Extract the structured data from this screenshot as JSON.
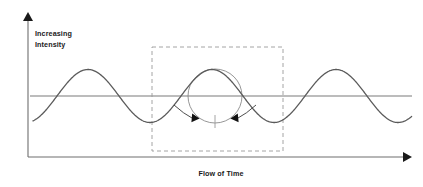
{
  "figure": {
    "background_color": "#ffffff"
  },
  "axes": {
    "y_label_line1": "Increasing",
    "y_label_line2": "Intensity",
    "x_label": "Flow of Time",
    "axis_color": "#1a1a1a",
    "midline_color": "#6e6e6e"
  },
  "annotations": {
    "highlight_box_color": "#9a9a9a",
    "circle_color": "#8a8a8a",
    "arrow_color": "#111111",
    "tick_color": "#9a9a9a"
  },
  "chart_data": {
    "type": "line",
    "title": "",
    "xlabel": "Flow of Time",
    "ylabel": "Increasing Intensity",
    "grid": false,
    "legend": null,
    "xlim": [
      0,
      423
    ],
    "ylim": [
      0,
      187
    ],
    "series": [
      {
        "name": "intensity-wave",
        "description": "Sinusoidal wave, three peaks, amplitude centered on horizontal midline",
        "color": "#5a5a5a",
        "wave": {
          "baseline_y": 96,
          "peak_y": 74,
          "trough_y": 127,
          "amplitude": 26.5,
          "period": 124,
          "x_start": 33,
          "x_end": 412,
          "peaks_x": [
            88,
            215,
            337
          ],
          "troughs_x": [
            150,
            277,
            400
          ]
        }
      }
    ],
    "overlays": [
      {
        "name": "highlight-box",
        "type": "dashed-rect",
        "x": 152,
        "y": 47,
        "width": 131,
        "height": 104
      },
      {
        "name": "cycle-circle",
        "type": "circle",
        "cx": 215,
        "cy": 96,
        "r": 27
      },
      {
        "name": "center-tick",
        "type": "vertical-tick",
        "x": 215,
        "y1": 115,
        "y2": 128
      },
      {
        "name": "left-inward-arrow",
        "type": "arrow",
        "direction": "right",
        "tip_x": 196,
        "tip_y": 119
      },
      {
        "name": "right-inward-arrow",
        "type": "arrow",
        "direction": "left",
        "tip_x": 234,
        "tip_y": 119
      }
    ]
  }
}
